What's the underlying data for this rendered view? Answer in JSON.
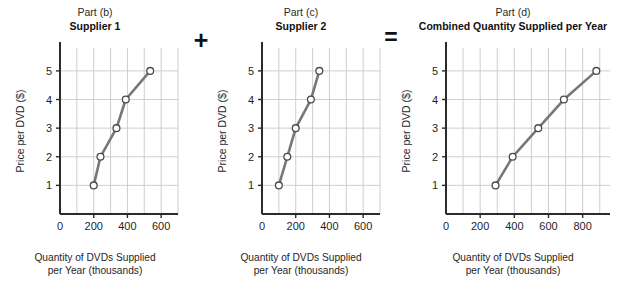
{
  "figure": {
    "background": "#ffffff",
    "line_color": "#777777",
    "marker_fill": "#ffffff",
    "marker_stroke": "#4a4a4a",
    "grid_color": "#c8c8cf",
    "axis_color": "#2b2b2b"
  },
  "operators": {
    "plus": "+",
    "equals": "="
  },
  "panels": [
    {
      "id": "panel-b",
      "part": "Part (b)",
      "title": "Supplier 1"
    },
    {
      "id": "panel-c",
      "part": "Part (c)",
      "title": "Supplier 2"
    },
    {
      "id": "panel-d",
      "part": "Part (d)",
      "title": "Combined Quantity Supplied per Year"
    }
  ],
  "axis_caption": {
    "line1": "Quantity of DVDs Supplied",
    "line2": "per Year (thousands)"
  },
  "chart_data": [
    {
      "type": "line",
      "title": "Supplier 1",
      "subtitle": "Part (b)",
      "xlabel": "Quantity of DVDs Supplied per Year (thousands)",
      "ylabel": "Price per DVD ($)",
      "x": [
        200,
        240,
        335,
        390,
        535
      ],
      "y": [
        1,
        2,
        3,
        4,
        5
      ],
      "xlim": [
        0,
        700
      ],
      "ylim": [
        0,
        5.8
      ],
      "xticks": [
        0,
        200,
        400,
        600
      ],
      "xtick_labels": [
        "0",
        "200",
        "400",
        "600"
      ],
      "yticks": [
        1,
        2,
        3,
        4,
        5
      ],
      "ytick_labels": [
        "1",
        "2",
        "3",
        "4",
        "5"
      ],
      "x_gridlines": [
        100,
        200,
        300,
        400,
        500,
        600,
        700
      ],
      "y_gridlines": [
        1,
        2,
        3,
        4,
        5
      ],
      "grid": true,
      "markers": "open-circle",
      "legend": null
    },
    {
      "type": "line",
      "title": "Supplier 2",
      "subtitle": "Part (c)",
      "xlabel": "Quantity of DVDs Supplied per Year (thousands)",
      "ylabel": "Price per DVD ($)",
      "x": [
        100,
        150,
        200,
        290,
        340
      ],
      "y": [
        1,
        2,
        3,
        4,
        5
      ],
      "xlim": [
        0,
        700
      ],
      "ylim": [
        0,
        5.8
      ],
      "xticks": [
        0,
        200,
        400,
        600
      ],
      "xtick_labels": [
        "0",
        "200",
        "400",
        "600"
      ],
      "yticks": [
        1,
        2,
        3,
        4,
        5
      ],
      "ytick_labels": [
        "1",
        "2",
        "3",
        "4",
        "5"
      ],
      "x_gridlines": [
        100,
        200,
        300,
        400,
        500,
        600,
        700
      ],
      "y_gridlines": [
        1,
        2,
        3,
        4,
        5
      ],
      "grid": true,
      "markers": "open-circle",
      "legend": null
    },
    {
      "type": "line",
      "title": "Combined Quantity Supplied per Year",
      "subtitle": "Part (d)",
      "xlabel": "Quantity of DVDs Supplied per Year (thousands)",
      "ylabel": "Price per DVD ($)",
      "x": [
        290,
        390,
        540,
        690,
        880
      ],
      "y": [
        1,
        2,
        3,
        4,
        5
      ],
      "xlim": [
        0,
        960
      ],
      "ylim": [
        0,
        5.8
      ],
      "xticks": [
        0,
        200,
        400,
        600,
        800
      ],
      "xtick_labels": [
        "0",
        "200",
        "400",
        "600",
        "800"
      ],
      "yticks": [
        1,
        2,
        3,
        4,
        5
      ],
      "ytick_labels": [
        "1",
        "2",
        "3",
        "4",
        "5"
      ],
      "x_gridlines": [
        100,
        200,
        300,
        400,
        500,
        600,
        700,
        800,
        900
      ],
      "y_gridlines": [
        1,
        2,
        3,
        4,
        5
      ],
      "grid": true,
      "markers": "open-circle",
      "legend": null
    }
  ]
}
